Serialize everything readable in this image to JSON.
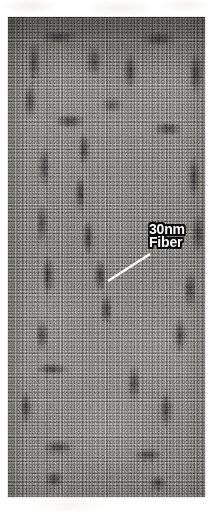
{
  "figure": {
    "kind": "electron-micrograph",
    "plate": {
      "x": 8,
      "y": 17,
      "width": 197,
      "height": 480,
      "background_tone": "#8d8d8d",
      "dark_tone": "#262626",
      "light_tone": "#a8a6a0"
    }
  },
  "annotation": {
    "label_line_1": "30nm",
    "label_line_2": "Fiber",
    "text_color": "#ffffff",
    "outline_color": "#0b0b0b",
    "leader": {
      "color": "#ffffff",
      "x1": 108,
      "y1": 281,
      "x2": 150,
      "y2": 254
    }
  },
  "page": {
    "background": "#ffffff",
    "width": 212,
    "height": 511
  }
}
